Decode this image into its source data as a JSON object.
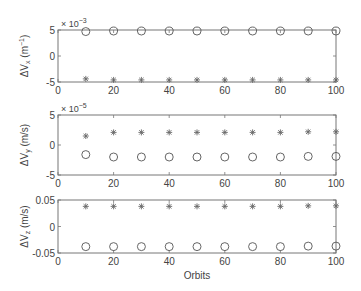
{
  "chart_data": [
    {
      "type": "scatter",
      "title": "",
      "xlabel": "",
      "ylabel": "ΔVx (m⁻¹)",
      "y_multiplier": "× 10⁻³",
      "xlim": [
        0,
        100
      ],
      "ylim": [
        -5,
        5
      ],
      "xticks": [
        "0",
        "20",
        "40",
        "60",
        "80",
        "100"
      ],
      "yticks": [
        "5",
        "0",
        "-5"
      ],
      "grid": false,
      "x": [
        10,
        20,
        30,
        40,
        50,
        60,
        70,
        80,
        90,
        100
      ],
      "series": [
        {
          "name": "circles",
          "marker": "o",
          "values": [
            4.7,
            4.8,
            4.8,
            4.8,
            4.8,
            4.8,
            4.8,
            4.8,
            4.8,
            4.8
          ]
        },
        {
          "name": "stars",
          "marker": "*",
          "values": [
            -4.4,
            -4.6,
            -4.6,
            -4.6,
            -4.6,
            -4.6,
            -4.6,
            -4.6,
            -4.6,
            -4.6
          ]
        }
      ]
    },
    {
      "type": "scatter",
      "title": "",
      "xlabel": "",
      "ylabel": "ΔVy (m/s)",
      "y_multiplier": "× 10⁻⁵",
      "xlim": [
        0,
        100
      ],
      "ylim": [
        -5,
        5
      ],
      "xticks": [
        "0",
        "20",
        "40",
        "60",
        "80",
        "100"
      ],
      "yticks": [
        "5",
        "0",
        "-5"
      ],
      "grid": false,
      "x": [
        10,
        20,
        30,
        40,
        50,
        60,
        70,
        80,
        90,
        100
      ],
      "series": [
        {
          "name": "stars",
          "marker": "*",
          "values": [
            1.5,
            2.1,
            2.1,
            2.1,
            2.1,
            2.1,
            2.1,
            2.1,
            2.2,
            2.2
          ]
        },
        {
          "name": "circles",
          "marker": "o",
          "values": [
            -1.6,
            -2.0,
            -2.0,
            -2.0,
            -2.0,
            -2.0,
            -2.0,
            -2.0,
            -1.9,
            -1.9
          ]
        }
      ]
    },
    {
      "type": "scatter",
      "title": "",
      "xlabel": "Orbits",
      "ylabel": "ΔVz (m/s)",
      "xlim": [
        0,
        100
      ],
      "ylim": [
        -0.05,
        0.05
      ],
      "xticks": [
        "0",
        "20",
        "40",
        "60",
        "80",
        "100"
      ],
      "yticks": [
        "0.05",
        "0",
        "-0.05"
      ],
      "grid": false,
      "x": [
        10,
        20,
        30,
        40,
        50,
        60,
        70,
        80,
        90,
        100
      ],
      "series": [
        {
          "name": "stars",
          "marker": "*",
          "values": [
            0.038,
            0.038,
            0.038,
            0.038,
            0.038,
            0.038,
            0.038,
            0.038,
            0.039,
            0.039
          ]
        },
        {
          "name": "circles",
          "marker": "o",
          "values": [
            -0.038,
            -0.038,
            -0.038,
            -0.038,
            -0.038,
            -0.038,
            -0.038,
            -0.038,
            -0.037,
            -0.037
          ]
        }
      ]
    }
  ],
  "labels": {
    "p1_ylabel_main": "ΔV",
    "p1_ylabel_sub": "x",
    "p1_ylabel_unit": " (m",
    "p1_ylabel_sup": "−1",
    "p1_ylabel_close": ")",
    "p1_exp": "× 10",
    "p1_exp_sup": "−3",
    "p2_ylabel_main": "ΔV",
    "p2_ylabel_sub": "y",
    "p2_ylabel_unit": " (m/s)",
    "p2_exp": "× 10",
    "p2_exp_sup": "−5",
    "p3_ylabel_main": "ΔV",
    "p3_ylabel_sub": "z",
    "p3_ylabel_unit": " (m/s)",
    "xlabel": "Orbits"
  }
}
